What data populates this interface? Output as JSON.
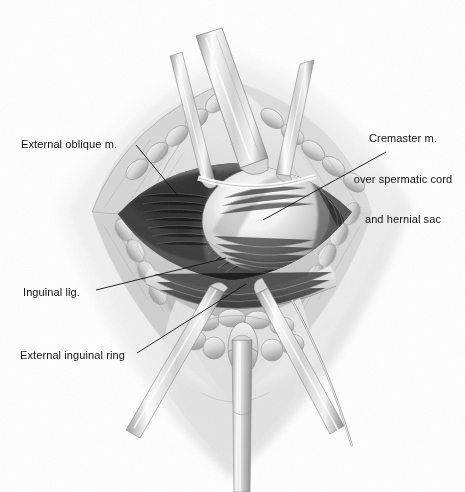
{
  "figure": {
    "style": "grayscale graphite medical illustration",
    "background_color": "#ffffff",
    "ink_color": "#111111"
  },
  "labels": [
    {
      "id": "external-oblique",
      "text": "External oblique m.",
      "align": "left",
      "x": 21,
      "y": 138,
      "leader": {
        "x1": 136,
        "y1": 145,
        "x2": 179,
        "y2": 197
      }
    },
    {
      "id": "cremaster",
      "line1": "Cremaster m.",
      "line2": "over spermatic cord",
      "line3": "and hernial sac",
      "align": "center",
      "x": 349,
      "y": 105,
      "leader": {
        "x1": 386,
        "y1": 152,
        "x2": 263,
        "y2": 220
      }
    },
    {
      "id": "inguinal-lig",
      "text": "Inguinal lig.",
      "align": "left",
      "x": 23,
      "y": 286,
      "leader": {
        "x1": 96,
        "y1": 290,
        "x2": 226,
        "y2": 258
      }
    },
    {
      "id": "external-inguinal-ring",
      "text": "External inguinal ring",
      "align": "left",
      "x": 20,
      "y": 349,
      "leader": {
        "x1": 137,
        "y1": 353,
        "x2": 246,
        "y2": 284
      }
    }
  ],
  "anatomy": {
    "wound": "diamond-shaped skin and fascia incision held open",
    "parts": [
      "external oblique aponeurosis",
      "cremaster muscle",
      "spermatic cord",
      "hernial sac",
      "inguinal ligament",
      "external inguinal ring",
      "subcutaneous fat lobules"
    ],
    "instruments": [
      "upper-left retractor blade",
      "upper-center retractor blade",
      "upper-right retractor blade",
      "lower-left retractor blade",
      "lower-right retractor blade",
      "inferior vertical retractor"
    ]
  }
}
